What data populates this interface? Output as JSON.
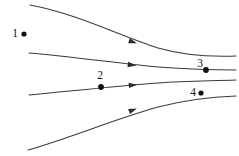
{
  "figure": {
    "type": "streamline-diagram",
    "width": 239,
    "height": 156,
    "background_color": "#ffffff",
    "curve_color": "#3a3a3a",
    "marker_color": "#111111",
    "label_color": "#151515"
  },
  "labels": {
    "p1": "1",
    "p2": "2",
    "p3": "3",
    "p4": "4"
  },
  "chart_data": {
    "type": "line",
    "title": "",
    "xlabel": "",
    "ylabel": "",
    "xlim": [
      0,
      239
    ],
    "ylim": [
      0,
      156
    ],
    "grid": false,
    "legend": "none",
    "series": [
      {
        "name": "streamline-1",
        "path": "M 30 5 C 78 14, 120 36, 158 48 C 182 55, 208 57, 236 56",
        "start": [
          30,
          5
        ],
        "end": [
          236,
          56
        ],
        "arrow": {
          "x": 133,
          "y": 42,
          "angle": 17
        }
      },
      {
        "name": "streamline-2",
        "path": "M 29 53 C 75 57, 116 63, 158 67 C 185 69, 210 70, 236 70",
        "start": [
          29,
          53
        ],
        "end": [
          236,
          70
        ],
        "arrow": {
          "x": 132,
          "y": 65,
          "angle": 7
        }
      },
      {
        "name": "streamline-3",
        "path": "M 29 95 C 72 91, 116 86, 158 83 C 185 81, 210 81, 236 80",
        "start": [
          29,
          95
        ],
        "end": [
          236,
          80
        ],
        "arrow": {
          "x": 133,
          "y": 85,
          "angle": -5
        }
      },
      {
        "name": "streamline-4",
        "path": "M 28 150 C 70 138, 112 120, 158 107 C 185 100, 210 97, 236 96",
        "start": [
          28,
          150
        ],
        "end": [
          236,
          96
        ],
        "arrow": {
          "x": 133,
          "y": 110,
          "angle": -22
        }
      }
    ],
    "annotations": [
      {
        "id": "1",
        "label": "1",
        "label_x": 15,
        "label_y": 37,
        "dot_x": 24,
        "dot_y": 34,
        "dot_r": 2.6,
        "on_curve": null
      },
      {
        "id": "2",
        "label": "2",
        "label_x": 100,
        "label_y": 79,
        "dot_x": 101,
        "dot_y": 87,
        "dot_r": 2.9,
        "on_curve": "streamline-3"
      },
      {
        "id": "3",
        "label": "3",
        "label_x": 200,
        "label_y": 67,
        "dot_x": 206,
        "dot_y": 70,
        "dot_r": 2.9,
        "on_curve": "streamline-2"
      },
      {
        "id": "4",
        "label": "4",
        "label_x": 193,
        "label_y": 96,
        "dot_x": 201,
        "dot_y": 93,
        "dot_r": 2.6,
        "on_curve": null
      }
    ]
  }
}
